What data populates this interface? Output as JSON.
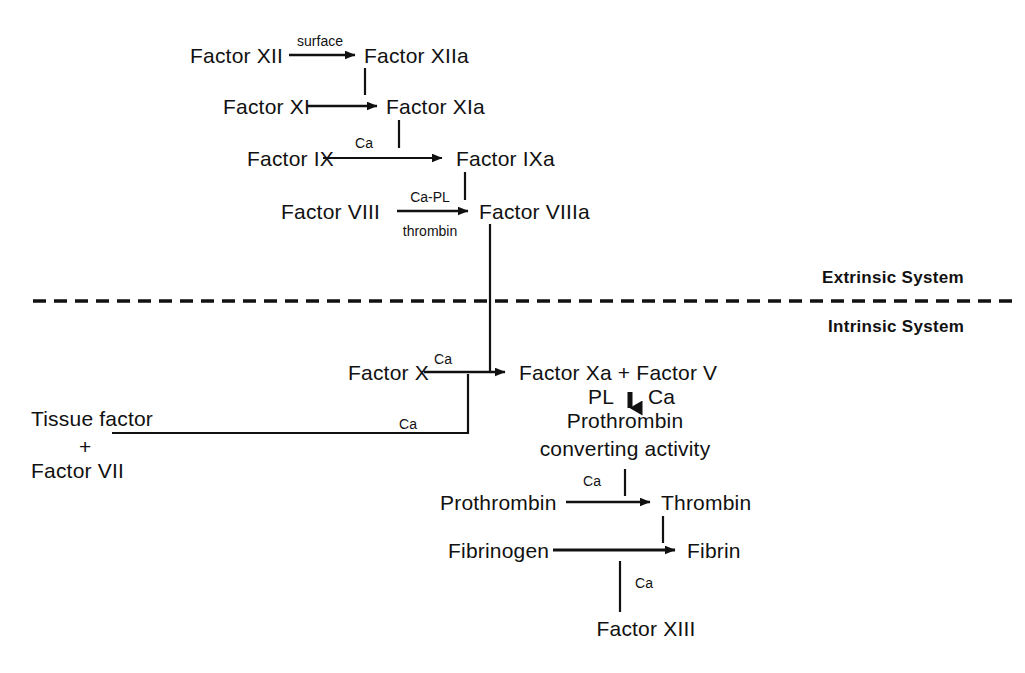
{
  "diagram": {
    "ink_color": "#111111",
    "background_color": "#ffffff"
  },
  "system_labels": {
    "extrinsic": "Extrinsic System",
    "intrinsic": "Intrinsic System"
  },
  "nodes": {
    "factor_xii": "Factor XII",
    "factor_xiia": "Factor XIIa",
    "factor_xi": "Factor XI",
    "factor_xia": "Factor XIa",
    "factor_ix": "Factor IX",
    "factor_ixa": "Factor IXa",
    "factor_viii": "Factor VIII",
    "factor_viiia": "Factor VIIIa",
    "factor_x": "Factor X",
    "factor_xa_plus_v": "Factor Xa +  Factor V",
    "tissue_factor": "Tissue factor",
    "tissue_plus": "+",
    "factor_vii": "Factor VII",
    "prothrombin_converting_1": "Prothrombin",
    "prothrombin_converting_2": "converting activity",
    "prothrombin": "Prothrombin",
    "thrombin": "Thrombin",
    "fibrinogen": "Fibrinogen",
    "fibrin": "Fibrin",
    "factor_xiii": "Factor XIII"
  },
  "cofactors": {
    "surface": "surface",
    "ca_ix": "Ca",
    "ca_pl": "Ca-PL",
    "thrombin_cofactor": "thrombin",
    "ca_x": "Ca",
    "ca_tissue": "Ca",
    "pl": "PL",
    "ca_complex": "Ca",
    "ca_prothrombin": "Ca",
    "ca_fibrin": "Ca"
  }
}
